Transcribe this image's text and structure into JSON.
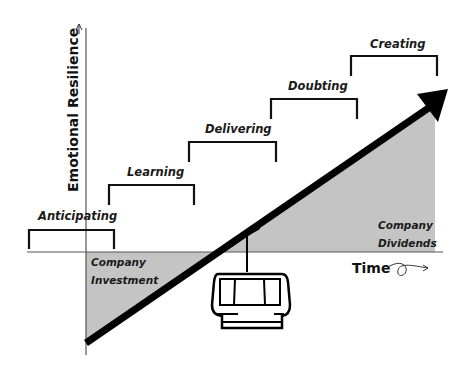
{
  "diagram": {
    "y_axis_label": "Emotional Resilience",
    "x_axis_label": "Time",
    "stages": [
      {
        "label": "Anticipating"
      },
      {
        "label": "Learning"
      },
      {
        "label": "Delivering"
      },
      {
        "label": "Doubting"
      },
      {
        "label": "Creating"
      }
    ],
    "regions": {
      "investment_line1": "Company",
      "investment_line2": "Investment",
      "dividends_line1": "Company",
      "dividends_line2": "Dividends"
    },
    "colors": {
      "shade": "#c4c4c4",
      "line": "#000000",
      "axis": "#555555"
    },
    "icons": {
      "vehicle": "cable-car-gondola-icon",
      "trend": "upward-arrow"
    }
  }
}
